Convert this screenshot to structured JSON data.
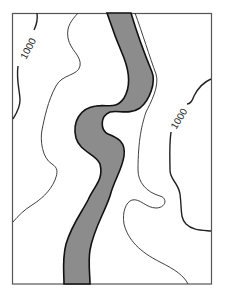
{
  "map": {
    "type": "topographic-contour-map",
    "contour_labels": [
      {
        "id": "left",
        "text": "1000"
      },
      {
        "id": "right",
        "text": "1000"
      }
    ],
    "features": {
      "river": {
        "name": "river-channel",
        "fill": "#8c8c8c",
        "stroke": "#1a1a1a"
      },
      "contour_stroke": "#2a2a2a",
      "frame_stroke": "#555555"
    }
  }
}
